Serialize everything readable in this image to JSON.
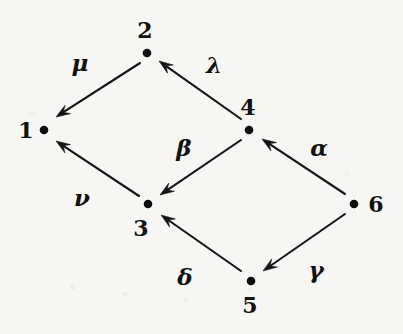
{
  "figure": {
    "kind": "directed-graph-quiver",
    "background_color": "#f7f6f3",
    "ink_color": "#141414",
    "width": 403,
    "height": 334
  },
  "nodes": [
    {
      "id": "1",
      "label": "1",
      "dot_x": 44,
      "dot_y": 130,
      "label_x": 26,
      "label_y": 130
    },
    {
      "id": "2",
      "label": "2",
      "dot_x": 147,
      "dot_y": 53,
      "label_x": 145,
      "label_y": 30
    },
    {
      "id": "3",
      "label": "3",
      "dot_x": 148,
      "dot_y": 204,
      "label_x": 141,
      "label_y": 228
    },
    {
      "id": "4",
      "label": "4",
      "dot_x": 249,
      "dot_y": 130,
      "label_x": 248,
      "label_y": 107
    },
    {
      "id": "5",
      "label": "5",
      "dot_x": 251,
      "dot_y": 281,
      "label_x": 250,
      "label_y": 305
    },
    {
      "id": "6",
      "label": "6",
      "dot_x": 354,
      "dot_y": 204,
      "label_x": 376,
      "label_y": 204
    }
  ],
  "edges": [
    {
      "id": "mu",
      "label": "μ",
      "from": "2",
      "to": "1",
      "label_x": 80,
      "label_y": 62,
      "x1": 140,
      "y1": 63,
      "x2": 56,
      "y2": 117
    },
    {
      "id": "lambda",
      "label": "λ",
      "from": "4",
      "to": "2",
      "label_x": 214,
      "label_y": 64,
      "x1": 241,
      "y1": 119,
      "x2": 159,
      "y2": 61
    },
    {
      "id": "beta",
      "label": "β",
      "from": "4",
      "to": "3",
      "label_x": 184,
      "label_y": 147,
      "x1": 241,
      "y1": 140,
      "x2": 160,
      "y2": 195
    },
    {
      "id": "alpha",
      "label": "α",
      "from": "6",
      "to": "4",
      "label_x": 319,
      "label_y": 147,
      "x1": 345,
      "y1": 194,
      "x2": 262,
      "y2": 139
    },
    {
      "id": "nu",
      "label": "ν",
      "from": "3",
      "to": "1",
      "label_x": 82,
      "label_y": 197,
      "x1": 139,
      "y1": 196,
      "x2": 56,
      "y2": 141
    },
    {
      "id": "delta",
      "label": "δ",
      "from": "5",
      "to": "3",
      "label_x": 185,
      "label_y": 276,
      "x1": 241,
      "y1": 271,
      "x2": 161,
      "y2": 215
    },
    {
      "id": "gamma",
      "label": "γ",
      "from": "6",
      "to": "5",
      "label_x": 316,
      "label_y": 269,
      "x1": 345,
      "y1": 214,
      "x2": 263,
      "y2": 271
    }
  ]
}
